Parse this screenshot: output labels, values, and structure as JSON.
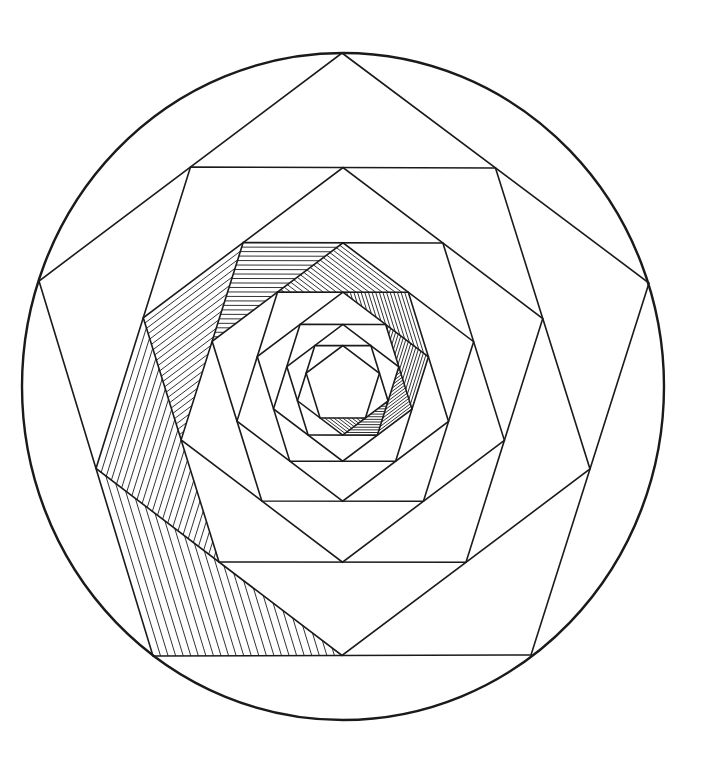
{
  "artwork": {
    "title": "Nested rotating pentagon spiral in circle",
    "canvas": {
      "width": 711,
      "height": 764,
      "background": "#ffffff"
    },
    "ink_color": "#1a1a1a",
    "circle": {
      "cx": 343,
      "cy": 386.5,
      "rx": 321,
      "ry": 333.5,
      "stroke_width": 2.4
    },
    "outer_pentagon": [
      [
        342,
        53
      ],
      [
        649,
        283
      ],
      [
        531,
        655
      ],
      [
        153,
        656
      ],
      [
        39,
        281
      ]
    ],
    "pentagon_levels": 11,
    "construction": "each pentagon's vertices are the midpoints of the previous pentagon's edges",
    "pentagon_stroke_width": 1.6,
    "hatching": {
      "levels": 10,
      "corner_index": 3,
      "direction": "parallel to edge from vertex[3] to vertex[4] of the parent pentagon",
      "base_spacing": 7,
      "spacing_decay": 0.86,
      "min_spacing": 2.6,
      "stroke_width": 0.9
    }
  }
}
